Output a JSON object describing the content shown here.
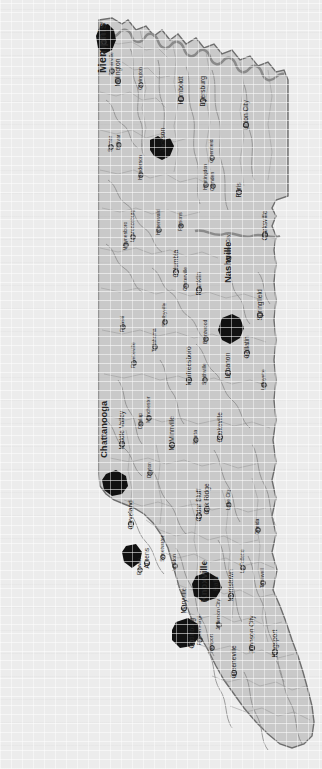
{
  "map": {
    "title": "Tennessee",
    "orientation": "rotated-90-ccw",
    "colors": {
      "background": "#ececec",
      "state_fill": "#c9c9c9",
      "state_border": "#6e6e6e",
      "county_line": "#9a9a9a",
      "river": "#8e8e8e",
      "urban_area": "#111111",
      "label": "#242424"
    },
    "legend_note": "",
    "cities": [
      {
        "name": "Memphis",
        "x": 103,
        "y": 71,
        "size": "xlarge",
        "dot": false,
        "angle": -90,
        "anchor": "start"
      },
      {
        "name": "Bartlett",
        "x": 104,
        "y": 42,
        "size": "small",
        "dot": true,
        "angle": -90,
        "anchor": "start"
      },
      {
        "name": "Millington",
        "x": 118,
        "y": 81,
        "size": "med",
        "dot": true,
        "angle": -90,
        "anchor": "start"
      },
      {
        "name": "Somerville",
        "x": 112,
        "y": 71,
        "size": "small",
        "dot": true,
        "angle": -90,
        "anchor": "start"
      },
      {
        "name": "Covington",
        "x": 141,
        "y": 85,
        "size": "small",
        "dot": true,
        "angle": -90,
        "anchor": "start"
      },
      {
        "name": "Bolivar",
        "x": 119,
        "y": 145,
        "size": "small",
        "dot": true,
        "angle": -90,
        "anchor": "start"
      },
      {
        "name": "Selmer",
        "x": 111,
        "y": 147,
        "size": "small",
        "dot": true,
        "angle": -90,
        "anchor": "start"
      },
      {
        "name": "Humboldt",
        "x": 181,
        "y": 99,
        "size": "med",
        "dot": true,
        "angle": -90,
        "anchor": "start"
      },
      {
        "name": "Dyersburg",
        "x": 203,
        "y": 101,
        "size": "med",
        "dot": true,
        "angle": -90,
        "anchor": "start"
      },
      {
        "name": "Union City",
        "x": 246,
        "y": 125,
        "size": "med",
        "dot": true,
        "angle": -90,
        "anchor": "start"
      },
      {
        "name": "Jackson",
        "x": 163,
        "y": 150,
        "size": "med",
        "dot": false,
        "angle": -90,
        "anchor": "start"
      },
      {
        "name": "Henderson",
        "x": 141,
        "y": 175,
        "size": "small",
        "dot": true,
        "angle": -90,
        "anchor": "start"
      },
      {
        "name": "Greenfield",
        "x": 212,
        "y": 158,
        "size": "small",
        "dot": true,
        "angle": -90,
        "anchor": "start"
      },
      {
        "name": "Camden",
        "x": 213,
        "y": 186,
        "size": "small",
        "dot": true,
        "angle": -90,
        "anchor": "start"
      },
      {
        "name": "Huntingdon",
        "x": 206,
        "y": 185,
        "size": "small",
        "dot": true,
        "angle": -90,
        "anchor": "start"
      },
      {
        "name": "Paris",
        "x": 239,
        "y": 192,
        "size": "med",
        "dot": true,
        "angle": -90,
        "anchor": "start"
      },
      {
        "name": "Parsons",
        "x": 181,
        "y": 226,
        "size": "small",
        "dot": true,
        "angle": -90,
        "anchor": "start"
      },
      {
        "name": "Hohenwald",
        "x": 159,
        "y": 230,
        "size": "small",
        "dot": true,
        "angle": -90,
        "anchor": "start"
      },
      {
        "name": "Lawrenceburg",
        "x": 133,
        "y": 237,
        "size": "small",
        "dot": true,
        "angle": -90,
        "anchor": "start"
      },
      {
        "name": "Waynesboro",
        "x": 126,
        "y": 245,
        "size": "small",
        "dot": true,
        "angle": -90,
        "anchor": "start"
      },
      {
        "name": "Clarksville",
        "x": 265,
        "y": 235,
        "size": "med",
        "dot": true,
        "angle": -90,
        "anchor": "start"
      },
      {
        "name": "Ashland City",
        "x": 229,
        "y": 258,
        "size": "small",
        "dot": true,
        "angle": -90,
        "anchor": "start"
      },
      {
        "name": "Nashville",
        "x": 229,
        "y": 281,
        "size": "large",
        "dot": false,
        "angle": -90,
        "anchor": "start"
      },
      {
        "name": "Columbia",
        "x": 176,
        "y": 272,
        "size": "med",
        "dot": true,
        "angle": -90,
        "anchor": "start"
      },
      {
        "name": "Centerville",
        "x": 186,
        "y": 286,
        "size": "small",
        "dot": true,
        "angle": -90,
        "anchor": "start"
      },
      {
        "name": "Franklin",
        "x": 199,
        "y": 290,
        "size": "med",
        "dot": true,
        "angle": -90,
        "anchor": "start"
      },
      {
        "name": "Pulaski",
        "x": 123,
        "y": 327,
        "size": "small",
        "dot": true,
        "angle": -90,
        "anchor": "start"
      },
      {
        "name": "Shelbyville",
        "x": 165,
        "y": 322,
        "size": "small",
        "dot": true,
        "angle": -90,
        "anchor": "start"
      },
      {
        "name": "Tullahoma",
        "x": 155,
        "y": 347,
        "size": "small",
        "dot": true,
        "angle": -90,
        "anchor": "start"
      },
      {
        "name": "Fayetteville",
        "x": 134,
        "y": 363,
        "size": "small",
        "dot": true,
        "angle": -90,
        "anchor": "start"
      },
      {
        "name": "Brentwood",
        "x": 206,
        "y": 339,
        "size": "small",
        "dot": true,
        "angle": -90,
        "anchor": "start"
      },
      {
        "name": "Springfield",
        "x": 260,
        "y": 315,
        "size": "med",
        "dot": true,
        "angle": -90,
        "anchor": "start"
      },
      {
        "name": "Gallatin",
        "x": 247,
        "y": 353,
        "size": "med",
        "dot": true,
        "angle": -90,
        "anchor": "start"
      },
      {
        "name": "Lebanon",
        "x": 228,
        "y": 373,
        "size": "med",
        "dot": true,
        "angle": -90,
        "anchor": "start"
      },
      {
        "name": "Lafayette",
        "x": 264,
        "y": 385,
        "size": "small",
        "dot": true,
        "angle": -90,
        "anchor": "start"
      },
      {
        "name": "Murfreesboro",
        "x": 189,
        "y": 380,
        "size": "med",
        "dot": true,
        "angle": -90,
        "anchor": "start"
      },
      {
        "name": "Smithville",
        "x": 205,
        "y": 380,
        "size": "small",
        "dot": true,
        "angle": -90,
        "anchor": "start"
      },
      {
        "name": "Manchester",
        "x": 149,
        "y": 418,
        "size": "small",
        "dot": true,
        "angle": -90,
        "anchor": "start"
      },
      {
        "name": "Dunlap",
        "x": 141,
        "y": 424,
        "size": "small",
        "dot": true,
        "angle": -90,
        "anchor": "start"
      },
      {
        "name": "Middle Valley",
        "x": 122,
        "y": 444,
        "size": "med",
        "dot": true,
        "angle": -90,
        "anchor": "start"
      },
      {
        "name": "Chattanooga",
        "x": 105,
        "y": 456,
        "size": "large",
        "dot": false,
        "angle": -90,
        "anchor": "start"
      },
      {
        "name": "McMinnville",
        "x": 172,
        "y": 445,
        "size": "med",
        "dot": true,
        "angle": -90,
        "anchor": "start"
      },
      {
        "name": "Sparta",
        "x": 196,
        "y": 440,
        "size": "small",
        "dot": true,
        "angle": -90,
        "anchor": "start"
      },
      {
        "name": "Cookeville",
        "x": 220,
        "y": 437,
        "size": "med",
        "dot": true,
        "angle": -90,
        "anchor": "start"
      },
      {
        "name": "Dayton",
        "x": 150,
        "y": 473,
        "size": "small",
        "dot": true,
        "angle": -90,
        "anchor": "start"
      },
      {
        "name": "Oak Ridge",
        "x": 207,
        "y": 509,
        "size": "med",
        "dot": true,
        "angle": -90,
        "anchor": "start"
      },
      {
        "name": "Cedar Bluff",
        "x": 199,
        "y": 516,
        "size": "med",
        "dot": true,
        "angle": -90,
        "anchor": "start"
      },
      {
        "name": "Lake City",
        "x": 229,
        "y": 505,
        "size": "small",
        "dot": true,
        "angle": -90,
        "anchor": "start"
      },
      {
        "name": "Oneida",
        "x": 258,
        "y": 530,
        "size": "small",
        "dot": true,
        "angle": -90,
        "anchor": "start"
      },
      {
        "name": "Cleveland",
        "x": 131,
        "y": 524,
        "size": "med",
        "dot": true,
        "angle": -90,
        "anchor": "start"
      },
      {
        "name": "Athens",
        "x": 147,
        "y": 563,
        "size": "med",
        "dot": true,
        "angle": -90,
        "anchor": "start"
      },
      {
        "name": "Etowah",
        "x": 140,
        "y": 570,
        "size": "small",
        "dot": true,
        "angle": -90,
        "anchor": "start"
      },
      {
        "name": "Sweetwater",
        "x": 163,
        "y": 557,
        "size": "small",
        "dot": true,
        "angle": -90,
        "anchor": "start"
      },
      {
        "name": "Loudon",
        "x": 175,
        "y": 566,
        "size": "small",
        "dot": true,
        "angle": -90,
        "anchor": "start"
      },
      {
        "name": "La Follette",
        "x": 243,
        "y": 568,
        "size": "small",
        "dot": true,
        "angle": -90,
        "anchor": "start"
      },
      {
        "name": "Tazewell",
        "x": 263,
        "y": 583,
        "size": "small",
        "dot": true,
        "angle": -90,
        "anchor": "start"
      },
      {
        "name": "Halls",
        "x": 216,
        "y": 589,
        "size": "med",
        "dot": false,
        "angle": -90,
        "anchor": "start"
      },
      {
        "name": "Knoxville",
        "x": 205,
        "y": 600,
        "size": "large",
        "dot": false,
        "angle": -90,
        "anchor": "start"
      },
      {
        "name": "Morristown",
        "x": 231,
        "y": 596,
        "size": "med",
        "dot": true,
        "angle": -90,
        "anchor": "start"
      },
      {
        "name": "Maryville",
        "x": 184,
        "y": 608,
        "size": "med",
        "dot": true,
        "angle": -90,
        "anchor": "start"
      },
      {
        "name": "Jefferson City",
        "x": 219,
        "y": 625,
        "size": "small",
        "dot": true,
        "angle": -90,
        "anchor": "start"
      },
      {
        "name": "Gatlinburg",
        "x": 192,
        "y": 643,
        "size": "med",
        "dot": true,
        "angle": -90,
        "anchor": "start"
      },
      {
        "name": "Pigeon Forge",
        "x": 200,
        "y": 640,
        "size": "small",
        "dot": true,
        "angle": -90,
        "anchor": "start"
      },
      {
        "name": "Newport",
        "x": 212,
        "y": 648,
        "size": "small",
        "dot": true,
        "angle": -90,
        "anchor": "start"
      },
      {
        "name": "Johnson City",
        "x": 252,
        "y": 648,
        "size": "med",
        "dot": true,
        "angle": -90,
        "anchor": "start"
      },
      {
        "name": "Kingsport",
        "x": 275,
        "y": 652,
        "size": "med",
        "dot": true,
        "angle": -90,
        "anchor": "start"
      },
      {
        "name": "Greeneville",
        "x": 234,
        "y": 673,
        "size": "med",
        "dot": true,
        "angle": -90,
        "anchor": "start"
      }
    ],
    "urban_areas": [
      {
        "name": "memphis-urban",
        "d": "M100,26 L108,24 L114,30 L116,40 L112,50 L104,54 L98,48 L96,36 Z"
      },
      {
        "name": "jackson-urban",
        "d": "M150,140 L158,136 L164,140 L170,138 L174,146 L170,156 L162,160 L154,156 L150,150 Z"
      },
      {
        "name": "nashville-urban",
        "d": "M222,318 L232,314 L240,318 L244,328 L240,338 L230,344 L222,340 L218,330 Z"
      },
      {
        "name": "chattanooga-urban",
        "d": "M106,474 L116,470 L126,476 L128,486 L122,494 L112,496 L104,490 L102,480 Z"
      },
      {
        "name": "cleveland-urban",
        "d": "M126,546 L136,544 L142,552 L140,562 L132,568 L124,562 L122,552 Z"
      },
      {
        "name": "knoxville-urban",
        "d": "M196,576 L208,572 L218,578 L222,588 L216,598 L204,602 L194,596 L192,584 Z"
      },
      {
        "name": "maryville-urban",
        "d": "M176,622 L188,618 L198,624 L200,636 L192,646 L180,648 L172,640 L172,630 Z"
      }
    ]
  }
}
